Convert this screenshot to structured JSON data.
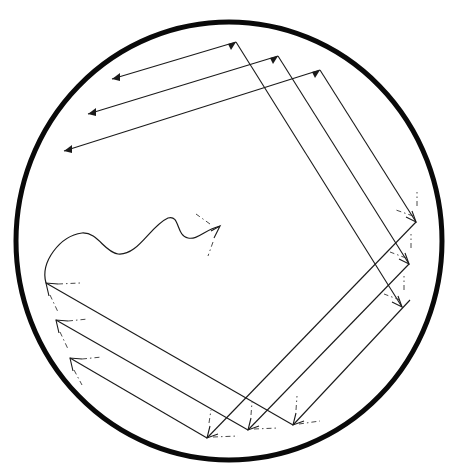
{
  "figure": {
    "colors": {
      "ink": "#1a1a1a",
      "rim": "#0a0a0a",
      "background": "#ffffff"
    },
    "circle": {
      "cx": 229,
      "cy": 241,
      "rx": 213,
      "ry": 219,
      "stroke_width": 5
    },
    "top_arrows": [
      {
        "from": [
          236,
          42
        ],
        "to": [
          112,
          79
        ]
      },
      {
        "from": [
          278,
          56
        ],
        "to": [
          88,
          114
        ]
      },
      {
        "from": [
          320,
          70
        ],
        "to": [
          64,
          151
        ]
      }
    ],
    "descending_rays": [
      {
        "from": [
          236,
          42
        ],
        "to": [
          402,
          307
        ]
      },
      {
        "from": [
          278,
          56
        ],
        "to": [
          409,
          264
        ]
      },
      {
        "from": [
          320,
          70
        ],
        "to": [
          416,
          222
        ]
      }
    ],
    "right_to_bottom_rays": [
      {
        "from": [
          416,
          222
        ],
        "to": [
          207,
          438
        ]
      },
      {
        "from": [
          409,
          264
        ],
        "to": [
          248,
          430
        ]
      },
      {
        "from": [
          402,
          307
        ],
        "to": [
          293,
          425
        ]
      }
    ],
    "bottom_to_left_rays": [
      {
        "from": [
          293,
          425
        ],
        "to": [
          46,
          283
        ]
      },
      {
        "from": [
          248,
          430
        ],
        "to": [
          56,
          320
        ]
      },
      {
        "from": [
          207,
          438
        ],
        "to": [
          70,
          358
        ]
      }
    ],
    "wavy_path": {
      "start": [
        46,
        283
      ],
      "tip": [
        220,
        226
      ]
    }
  }
}
